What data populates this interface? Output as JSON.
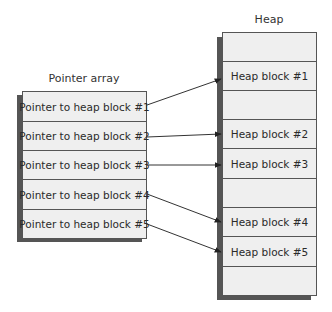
{
  "pointer_array": {
    "title": "Pointer array",
    "cells": [
      {
        "label": "Pointer to heap block #1"
      },
      {
        "label": "Pointer to heap block #2"
      },
      {
        "label": "Pointer to heap block #3"
      },
      {
        "label": "Pointer to heap block #4"
      },
      {
        "label": "Pointer to heap block #5"
      }
    ]
  },
  "heap": {
    "title": "Heap",
    "cells": [
      {
        "label": ""
      },
      {
        "label": "Heap block #1"
      },
      {
        "label": ""
      },
      {
        "label": "Heap block #2"
      },
      {
        "label": "Heap block #3"
      },
      {
        "label": ""
      },
      {
        "label": "Heap block #4"
      },
      {
        "label": "Heap block #5"
      },
      {
        "label": ""
      }
    ]
  },
  "arrows": [
    {
      "from": "Pointer to heap block #1",
      "to": "Heap block #1"
    },
    {
      "from": "Pointer to heap block #2",
      "to": "Heap block #2"
    },
    {
      "from": "Pointer to heap block #3",
      "to": "Heap block #3"
    },
    {
      "from": "Pointer to heap block #4",
      "to": "Heap block #4"
    },
    {
      "from": "Pointer to heap block #5",
      "to": "Heap block #5"
    }
  ]
}
